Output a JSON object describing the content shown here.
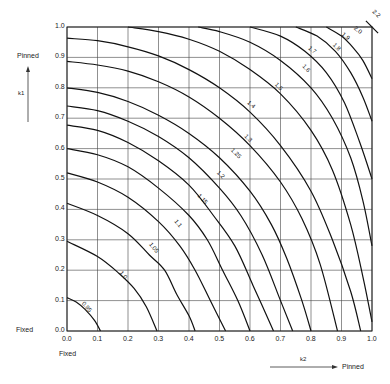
{
  "chart_data": {
    "type": "line",
    "title": "",
    "xlabel": "k2",
    "ylabel": "k1",
    "xlim": [
      0.0,
      1.0
    ],
    "ylim": [
      0.0,
      1.0
    ],
    "grid": true,
    "x_ticks": [
      "0.0",
      "0.1",
      "0.2",
      "0.3",
      "0.4",
      "0.5",
      "0.6",
      "0.7",
      "0.8",
      "0.9",
      "1.0"
    ],
    "y_ticks": [
      "0.0",
      "0.1",
      "0.2",
      "0.3",
      "0.4",
      "0.5",
      "0.6",
      "0.7",
      "0.8",
      "0.9",
      "1.0"
    ],
    "annotations": {
      "y_axis_top": "Pinned",
      "y_axis_bottom": "Fixed",
      "x_axis_left": "Fixed",
      "x_axis_right": "Pinned",
      "y_axis_symbol": "k1",
      "x_axis_symbol": "k2"
    },
    "series": [
      {
        "name": "0.95",
        "points": [
          [
            0,
            0.11
          ],
          [
            0.03,
            0.095
          ],
          [
            0.06,
            0.07
          ],
          [
            0.09,
            0.035
          ],
          [
            0.11,
            0
          ]
        ]
      },
      {
        "name": "1.0",
        "points": [
          [
            0,
            0.295
          ],
          [
            0.1,
            0.245
          ],
          [
            0.17,
            0.19
          ],
          [
            0.22,
            0.14
          ],
          [
            0.26,
            0.08
          ],
          [
            0.295,
            0
          ]
        ]
      },
      {
        "name": "1.05",
        "points": [
          [
            0,
            0.42
          ],
          [
            0.1,
            0.38
          ],
          [
            0.2,
            0.32
          ],
          [
            0.27,
            0.25
          ],
          [
            0.32,
            0.2
          ],
          [
            0.36,
            0.12
          ],
          [
            0.4,
            0.05
          ],
          [
            0.42,
            0
          ]
        ]
      },
      {
        "name": "1.1",
        "points": [
          [
            0,
            0.52
          ],
          [
            0.1,
            0.49
          ],
          [
            0.2,
            0.44
          ],
          [
            0.3,
            0.36
          ],
          [
            0.37,
            0.28
          ],
          [
            0.42,
            0.2
          ],
          [
            0.47,
            0.1
          ],
          [
            0.52,
            0
          ]
        ]
      },
      {
        "name": "1.15",
        "points": [
          [
            0,
            0.6
          ],
          [
            0.1,
            0.58
          ],
          [
            0.2,
            0.54
          ],
          [
            0.3,
            0.47
          ],
          [
            0.4,
            0.38
          ],
          [
            0.46,
            0.3
          ],
          [
            0.51,
            0.2
          ],
          [
            0.56,
            0.1
          ],
          [
            0.6,
            0
          ]
        ]
      },
      {
        "name": "1.2",
        "points": [
          [
            0,
            0.677
          ],
          [
            0.1,
            0.66
          ],
          [
            0.2,
            0.62
          ],
          [
            0.3,
            0.56
          ],
          [
            0.4,
            0.48
          ],
          [
            0.48,
            0.38
          ],
          [
            0.55,
            0.28
          ],
          [
            0.61,
            0.15
          ],
          [
            0.677,
            0
          ]
        ]
      },
      {
        "name": "1.25",
        "points": [
          [
            0,
            0.74
          ],
          [
            0.1,
            0.725
          ],
          [
            0.2,
            0.69
          ],
          [
            0.3,
            0.64
          ],
          [
            0.4,
            0.57
          ],
          [
            0.5,
            0.47
          ],
          [
            0.57,
            0.38
          ],
          [
            0.64,
            0.25
          ],
          [
            0.7,
            0.1
          ],
          [
            0.74,
            0
          ]
        ]
      },
      {
        "name": "1.3",
        "points": [
          [
            0,
            0.8
          ],
          [
            0.1,
            0.785
          ],
          [
            0.2,
            0.755
          ],
          [
            0.3,
            0.71
          ],
          [
            0.4,
            0.65
          ],
          [
            0.5,
            0.57
          ],
          [
            0.6,
            0.46
          ],
          [
            0.67,
            0.35
          ],
          [
            0.72,
            0.24
          ],
          [
            0.77,
            0.1
          ],
          [
            0.8,
            0
          ]
        ]
      },
      {
        "name": "1.4",
        "points": [
          [
            0,
            0.887
          ],
          [
            0.1,
            0.875
          ],
          [
            0.2,
            0.855
          ],
          [
            0.3,
            0.82
          ],
          [
            0.4,
            0.77
          ],
          [
            0.5,
            0.7
          ],
          [
            0.6,
            0.61
          ],
          [
            0.7,
            0.49
          ],
          [
            0.77,
            0.37
          ],
          [
            0.83,
            0.22
          ],
          [
            0.887,
            0
          ]
        ]
      },
      {
        "name": "1.5",
        "points": [
          [
            0,
            0.963
          ],
          [
            0.1,
            0.955
          ],
          [
            0.2,
            0.935
          ],
          [
            0.3,
            0.905
          ],
          [
            0.4,
            0.86
          ],
          [
            0.5,
            0.8
          ],
          [
            0.6,
            0.72
          ],
          [
            0.7,
            0.61
          ],
          [
            0.8,
            0.46
          ],
          [
            0.87,
            0.3
          ],
          [
            0.93,
            0.13
          ],
          [
            0.963,
            0
          ]
        ]
      },
      {
        "name": "1.6",
        "points": [
          [
            0.2,
            1.0
          ],
          [
            0.3,
            0.985
          ],
          [
            0.4,
            0.96
          ],
          [
            0.5,
            0.92
          ],
          [
            0.6,
            0.86
          ],
          [
            0.7,
            0.78
          ],
          [
            0.8,
            0.66
          ],
          [
            0.87,
            0.53
          ],
          [
            0.93,
            0.35
          ],
          [
            0.97,
            0.18
          ],
          [
            1.0,
            0.03
          ]
        ]
      },
      {
        "name": "1.7",
        "points": [
          [
            0.43,
            1.0
          ],
          [
            0.5,
            0.985
          ],
          [
            0.6,
            0.95
          ],
          [
            0.7,
            0.89
          ],
          [
            0.8,
            0.8
          ],
          [
            0.87,
            0.7
          ],
          [
            0.93,
            0.57
          ],
          [
            0.97,
            0.43
          ],
          [
            1.0,
            0.28
          ]
        ]
      },
      {
        "name": "1.8",
        "points": [
          [
            0.6,
            1.0
          ],
          [
            0.7,
            0.97
          ],
          [
            0.78,
            0.92
          ],
          [
            0.85,
            0.85
          ],
          [
            0.91,
            0.75
          ],
          [
            0.96,
            0.62
          ],
          [
            1.0,
            0.5
          ]
        ]
      },
      {
        "name": "1.9",
        "points": [
          [
            0.75,
            1.0
          ],
          [
            0.82,
            0.97
          ],
          [
            0.88,
            0.92
          ],
          [
            0.93,
            0.85
          ],
          [
            0.97,
            0.77
          ],
          [
            1.0,
            0.69
          ]
        ]
      },
      {
        "name": "2.0",
        "points": [
          [
            0.85,
            1.0
          ],
          [
            0.9,
            0.97
          ],
          [
            0.94,
            0.93
          ],
          [
            0.97,
            0.89
          ],
          [
            1.0,
            0.83
          ]
        ]
      },
      {
        "name": "2.2",
        "points": [
          [
            0.98,
            1.02
          ],
          [
            1.0,
            1.0
          ],
          [
            1.02,
            0.98
          ]
        ]
      }
    ],
    "curve_labels": [
      {
        "text": "0.95",
        "at": [
          0.06,
          0.075
        ],
        "rot": 50
      },
      {
        "text": "1.0",
        "at": [
          0.18,
          0.18
        ],
        "rot": 50
      },
      {
        "text": "1.05",
        "at": [
          0.28,
          0.27
        ],
        "rot": 50
      },
      {
        "text": "1.1",
        "at": [
          0.36,
          0.35
        ],
        "rot": 50
      },
      {
        "text": "1.15",
        "at": [
          0.44,
          0.43
        ],
        "rot": 48
      },
      {
        "text": "1.2",
        "at": [
          0.5,
          0.51
        ],
        "rot": 45
      },
      {
        "text": "1.25",
        "at": [
          0.55,
          0.58
        ],
        "rot": 45
      },
      {
        "text": "1.3",
        "at": [
          0.59,
          0.63
        ],
        "rot": 45
      },
      {
        "text": "1.4",
        "at": [
          0.6,
          0.74
        ],
        "rot": 40
      },
      {
        "text": "1.5",
        "at": [
          0.69,
          0.8
        ],
        "rot": 45
      },
      {
        "text": "1.6",
        "at": [
          0.78,
          0.86
        ],
        "rot": 45
      },
      {
        "text": "1.7",
        "at": [
          0.8,
          0.92
        ],
        "rot": 40
      },
      {
        "text": "1.8",
        "at": [
          0.88,
          0.93
        ],
        "rot": 45
      },
      {
        "text": "1.9",
        "at": [
          0.91,
          0.965
        ],
        "rot": 40
      },
      {
        "text": "2.0",
        "at": [
          0.95,
          0.985
        ],
        "rot": 40
      },
      {
        "text": "2.2",
        "at": [
          1.01,
          1.04
        ],
        "rot": 45
      }
    ]
  }
}
